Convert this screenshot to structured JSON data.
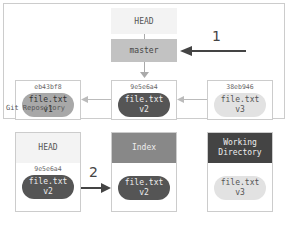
{
  "repository": {
    "label": "Git Repository",
    "head": "HEAD",
    "branch": "master",
    "commits": [
      {
        "hash": "eb43bf8",
        "file": "file.txt",
        "version": "v1"
      },
      {
        "hash": "9e5e6a4",
        "file": "file.txt",
        "version": "v2"
      },
      {
        "hash": "38eb946",
        "file": "file.txt",
        "version": "v3"
      }
    ],
    "step_label": "1"
  },
  "trees": [
    {
      "title": "HEAD",
      "hash": "9e5e6a4",
      "file": "file.txt",
      "version": "v2"
    },
    {
      "title": "Index",
      "file": "file.txt",
      "version": "v2"
    },
    {
      "title": "Working Directory",
      "file": "file.txt",
      "version": "v3"
    }
  ],
  "step2_label": "2",
  "colors": {
    "head": "#f3f3f3",
    "master": "#c2c2c2",
    "index": "#888888",
    "workdir": "#444444"
  }
}
